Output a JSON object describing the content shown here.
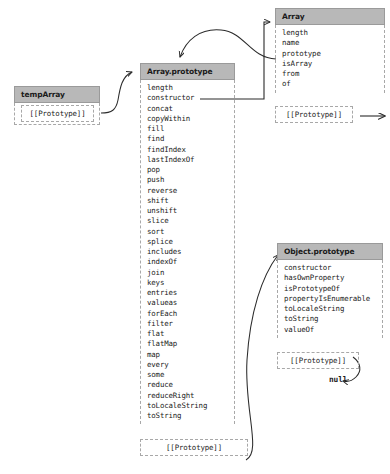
{
  "diagram": {
    "null_label": "null",
    "prototype_label": "[[Prototype]]",
    "boxes": {
      "temp_array": {
        "header": "tempArray",
        "properties": [],
        "prototype_label": "[[Prototype]]"
      },
      "array_prototype": {
        "header": "Array.prototype",
        "properties": [
          "length",
          "constructor",
          "concat",
          "copyWithin",
          "fill",
          "find",
          "findIndex",
          "lastIndexOf",
          "pop",
          "push",
          "reverse",
          "shift",
          "unshift",
          "slice",
          "sort",
          "splice",
          "includes",
          "indexOf",
          "join",
          "keys",
          "entries",
          "valueas",
          "forEach",
          "filter",
          "flat",
          "flatMap",
          "map",
          "every",
          "some",
          "reduce",
          "reduceRight",
          "toLocaleString",
          "toString"
        ],
        "prototype_label": "[[Prototype]]"
      },
      "array": {
        "header": "Array",
        "properties": [
          "length",
          "name",
          "prototype",
          "isArray",
          "from",
          "of"
        ],
        "prototype_label": "[[Prototype]]"
      },
      "object_prototype": {
        "header": "Object.prototype",
        "properties": [
          "constructor",
          "hasOwnProperty",
          "isPrototypeOf",
          "propertyIsEnumerable",
          "toLocaleString",
          "toString",
          "valueOf"
        ],
        "prototype_label": "[[Prototype]]"
      }
    },
    "colors": {
      "header_fill": "#b8b8b8",
      "header_border": "#9a9a9a",
      "body_border": "#a8a8a8",
      "text": "#1b1b1b",
      "arrow": "#2b2b2b",
      "background": "#ffffff"
    }
  }
}
